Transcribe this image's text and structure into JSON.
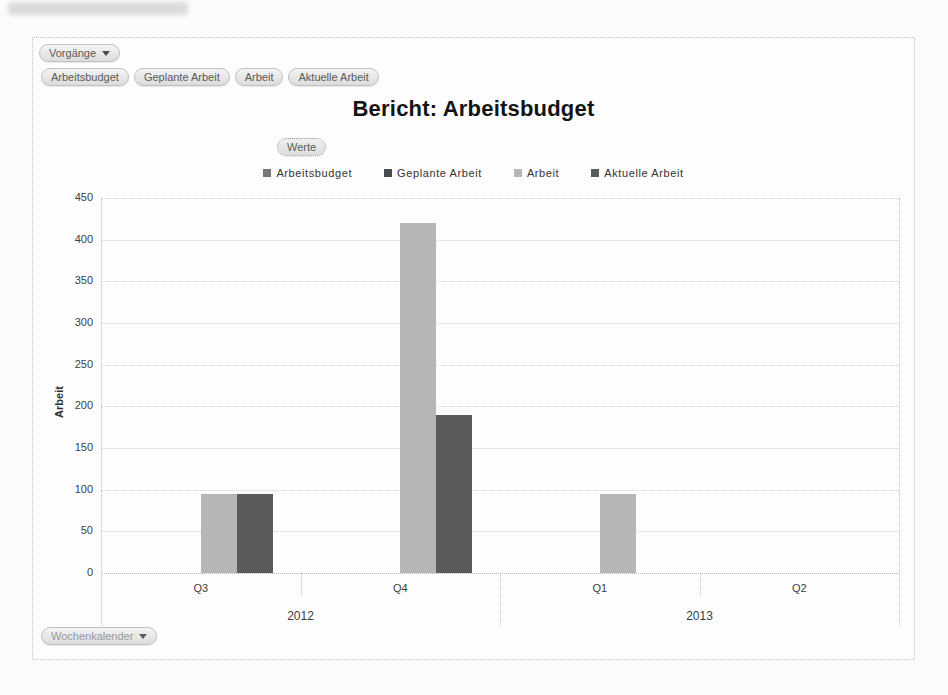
{
  "window": {
    "blurred_header_note": "unreadable blurred text strip"
  },
  "toolbar": {
    "vorgaenge_label": "Vorgänge",
    "filters": [
      "Arbeitsbudget",
      "Geplante Arbeit",
      "Arbeit",
      "Aktuelle Arbeit"
    ],
    "werte_label": "Werte",
    "wochenkalender_label": "Wochenkalender"
  },
  "chart_data": {
    "type": "bar",
    "title": "Bericht: Arbeitsbudget",
    "ylabel": "Arbeit",
    "xlabel": "",
    "ylim": [
      0,
      450
    ],
    "ytick_step": 50,
    "grid": true,
    "legend_position": "top",
    "categories": [
      "Q3",
      "Q4",
      "Q1",
      "Q2"
    ],
    "category_groups": [
      {
        "label": "2012",
        "span": [
          0,
          1
        ]
      },
      {
        "label": "2013",
        "span": [
          2,
          3
        ]
      }
    ],
    "series": [
      {
        "name": "Arbeitsbudget",
        "color": "#77787a",
        "values": [
          0,
          0,
          0,
          0
        ]
      },
      {
        "name": "Geplante Arbeit",
        "color": "#4a4b4d",
        "values": [
          0,
          0,
          0,
          0
        ]
      },
      {
        "name": "Arbeit",
        "color": "#b4b6b8",
        "values": [
          95,
          420,
          95,
          0
        ]
      },
      {
        "name": "Aktuelle Arbeit",
        "color": "#5a5b5d",
        "values": [
          95,
          190,
          0,
          0
        ]
      }
    ]
  }
}
